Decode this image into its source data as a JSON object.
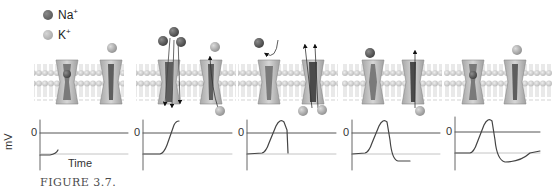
{
  "legend": {
    "items": [
      {
        "ion": "Na",
        "charge": "+",
        "color": "#5a5a5a"
      },
      {
        "ion": "K",
        "charge": "+",
        "color": "#a8a8a8"
      }
    ]
  },
  "axes": {
    "ylabel": "mV",
    "xlabel": "Time",
    "zero_label": "0"
  },
  "panels": [
    {
      "stage": "resting",
      "na_channel": "closed",
      "k_channel": "closed"
    },
    {
      "stage": "depolarization",
      "na_channel": "open-influx",
      "k_channel": "opening-efflux"
    },
    {
      "stage": "peak-repolarization-begins",
      "na_channel": "inactivated",
      "k_channel": "open-efflux"
    },
    {
      "stage": "repolarization",
      "na_channel": "closed",
      "k_channel": "open-efflux"
    },
    {
      "stage": "hyperpolarization-return",
      "na_channel": "closed",
      "k_channel": "closed"
    }
  ],
  "caption": "FIGURE 3.7.",
  "colors": {
    "na": "#5a5a5a",
    "k": "#a8a8a8",
    "membrane_head": "#cfcfcf",
    "channel": "#b8b8b8",
    "channel_pore": "#6d6d6d",
    "trace": "#555555",
    "zero_line": "#555555",
    "rest_line": "#bdbdbd"
  }
}
